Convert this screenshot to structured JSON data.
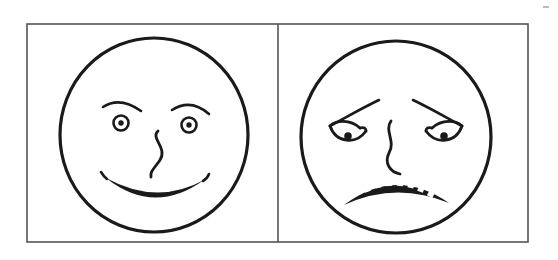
{
  "image": {
    "title": "Two line-drawn faces: happy and sad",
    "width": 558,
    "height": 260,
    "background_color": "#ffffff",
    "ink_color": "#1a1a1a",
    "frame_color": "#555555",
    "style": "hand-drawn black ink line art, two-panel comparison"
  },
  "frame": {
    "name": "outer-rectangle",
    "x": 27,
    "y": 24,
    "width": 501,
    "height": 218,
    "divider_x": 278,
    "panel_count": 2
  },
  "panels": [
    {
      "id": "left",
      "name": "happy-face-panel",
      "label": "happy",
      "expression": "smiling",
      "face": {
        "center_x": 154,
        "center_y": 135,
        "radius_x": 94,
        "radius_y": 97
      },
      "features": {
        "eyes": {
          "type": "concentric-circle",
          "left": {
            "cx": 121,
            "cy": 122
          },
          "right": {
            "cx": 189,
            "cy": 124
          },
          "ring_radius": 7.5,
          "pupil_radius": 2.6
        },
        "eyebrows": {
          "type": "arched-upward",
          "left": {
            "from_x": 103,
            "from_y": 106,
            "to_x": 141,
            "to_y": 110
          },
          "right": {
            "from_x": 172,
            "from_y": 108,
            "to_x": 209,
            "to_y": 113
          }
        },
        "nose": {
          "type": "s-curve-hook",
          "top_x": 158,
          "top_y": 130,
          "bottom_x": 152,
          "bottom_y": 176
        },
        "mouth": {
          "type": "smile-arc-with-teeth",
          "left_x": 101,
          "right_x": 209,
          "depth_y": 202,
          "teeth_count": 9
        }
      }
    },
    {
      "id": "right",
      "name": "sad-face-panel",
      "label": "sad",
      "expression": "frowning",
      "face": {
        "center_x": 396,
        "center_y": 137,
        "radius_x": 95,
        "radius_y": 96
      },
      "features": {
        "eyes": {
          "type": "almond-with-solid-pupil",
          "left": {
            "cx": 351,
            "cy": 127
          },
          "right": {
            "cx": 441,
            "cy": 127
          },
          "pupil_radius": 3.6
        },
        "eyebrows": {
          "type": "angled-down-outward-sad",
          "left": {
            "inner_x": 378,
            "inner_y": 101,
            "outer_x": 324,
            "outer_y": 128
          },
          "right": {
            "inner_x": 414,
            "inner_y": 101,
            "outer_x": 468,
            "outer_y": 128
          }
        },
        "nose": {
          "type": "s-curve-hook",
          "top_x": 392,
          "top_y": 122,
          "bottom_x": 400,
          "bottom_y": 175
        },
        "mouth": {
          "type": "frown-arc-with-teeth",
          "left_x": 345,
          "right_x": 448,
          "peak_y": 182,
          "teeth_count": 8
        }
      }
    }
  ],
  "artifacts": {
    "top_right_speck": {
      "x": 543,
      "y": 6,
      "width": 6,
      "height": 2
    }
  }
}
